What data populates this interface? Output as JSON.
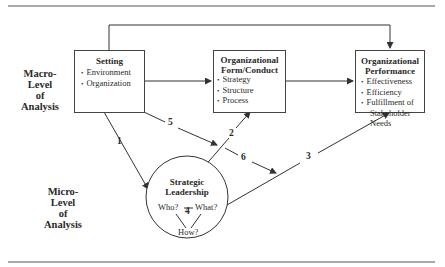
{
  "levels": {
    "macro": [
      "Macro-",
      "Level",
      "of",
      "Analysis"
    ],
    "micro": [
      "Micro-",
      "Level",
      "of",
      "Analysis"
    ]
  },
  "boxes": {
    "setting": {
      "title": "Setting",
      "items": [
        "Environment",
        "Organization"
      ]
    },
    "form": {
      "title_line1": "Organizational",
      "title_line2": "Form/Conduct",
      "items": [
        "Strategy",
        "Structure",
        "Process"
      ]
    },
    "performance": {
      "title_line1": "Organizational",
      "title_line2": "Performance",
      "items": [
        "Effectiveness",
        "Efficiency",
        "Fulfillment of",
        "Stakeholder Needs"
      ]
    }
  },
  "circle": {
    "title_line1": "Strategic",
    "title_line2": "Leadership",
    "who": "Who?",
    "what": "What?",
    "how": "How?",
    "link": "4"
  },
  "arrows": {
    "a1": "1",
    "a2": "2",
    "a3": "3",
    "a5": "5",
    "a6": "6"
  }
}
